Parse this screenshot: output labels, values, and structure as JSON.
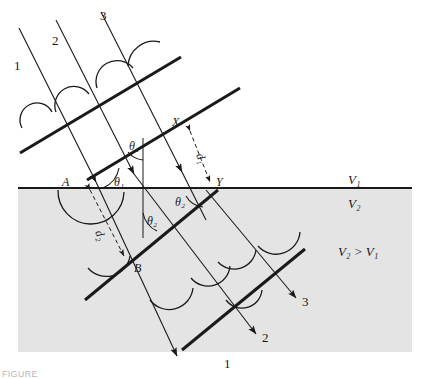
{
  "figure": {
    "background_color": "#ffffff",
    "medium2_fill": "#e4e4e4",
    "line_color": "#1a1a1a"
  },
  "media": {
    "upper_label": "V₁",
    "lower_label": "V₂",
    "relation": "V₂ > V₁",
    "upper_name": "medium-1",
    "lower_name": "medium-2"
  },
  "points": {
    "a": "A",
    "b": "B",
    "x": "X",
    "y": "Y"
  },
  "angles": {
    "theta1_wavefront": "θ₁",
    "theta1_interface": "θ₁",
    "theta2_normal": "θ₂",
    "theta2_interface": "θ₂"
  },
  "distances": {
    "d1": "d₁",
    "d2": "d₂"
  },
  "incident_rays": [
    {
      "id": "1",
      "label": "1"
    },
    {
      "id": "2",
      "label": "2"
    },
    {
      "id": "3",
      "label": "3"
    }
  ],
  "refracted_rays": [
    {
      "id": "1",
      "label": "1"
    },
    {
      "id": "2",
      "label": "2"
    },
    {
      "id": "3",
      "label": "3"
    }
  ],
  "caption": "FIGURE"
}
